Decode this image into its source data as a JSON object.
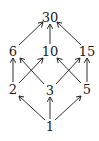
{
  "diagram": {
    "type": "hasse-diagram",
    "nodes": [
      {
        "id": "n30",
        "label": "30",
        "x": 50,
        "y": 17
      },
      {
        "id": "n6",
        "label": "6",
        "x": 13,
        "y": 51
      },
      {
        "id": "n10",
        "label": "10",
        "x": 50,
        "y": 51
      },
      {
        "id": "n15",
        "label": "15",
        "x": 87,
        "y": 51
      },
      {
        "id": "n2",
        "label": "2",
        "x": 13,
        "y": 89
      },
      {
        "id": "n3",
        "label": "3",
        "x": 50,
        "y": 90
      },
      {
        "id": "n5",
        "label": "5",
        "x": 87,
        "y": 89
      },
      {
        "id": "n1",
        "label": "1",
        "x": 50,
        "y": 126
      }
    ],
    "edges": [
      [
        "1",
        "2"
      ],
      [
        "1",
        "3"
      ],
      [
        "1",
        "5"
      ],
      [
        "2",
        "6"
      ],
      [
        "2",
        "10"
      ],
      [
        "3",
        "6"
      ],
      [
        "3",
        "15"
      ],
      [
        "5",
        "10"
      ],
      [
        "5",
        "15"
      ],
      [
        "6",
        "30"
      ],
      [
        "10",
        "30"
      ],
      [
        "15",
        "30"
      ]
    ]
  }
}
